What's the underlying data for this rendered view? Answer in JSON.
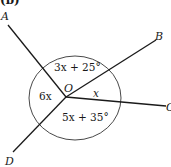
{
  "figure": {
    "part_label": "(b)",
    "center_point": "O",
    "points": {
      "A": "A",
      "B": "B",
      "C": "C",
      "D": "D"
    },
    "angles": [
      {
        "between": "OA-OB",
        "label": "3x + 25°"
      },
      {
        "between": "OB-OC",
        "label": "x"
      },
      {
        "between": "OC-OD",
        "label": "5x + 35°"
      },
      {
        "between": "OD-OA",
        "label": "6x"
      }
    ],
    "colors": {
      "line": "#1a1a1a",
      "background": "#ffffff"
    }
  }
}
